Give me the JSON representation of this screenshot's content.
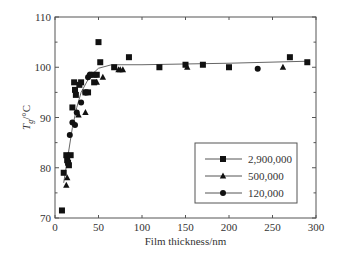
{
  "chart_data": {
    "type": "scatter",
    "title": "",
    "xlabel": "Film thickness/nm",
    "ylabel": "T_g/°C",
    "ylabel_main": "T",
    "ylabel_sub": "g",
    "ylabel_unit": "/°C",
    "xlim": [
      0,
      300
    ],
    "ylim": [
      70,
      110
    ],
    "xticks": [
      0,
      50,
      100,
      150,
      200,
      250,
      300
    ],
    "yticks": [
      70,
      80,
      90,
      100,
      110
    ],
    "grid": false,
    "legend_position": "lower right",
    "series": [
      {
        "name": "2,900,000",
        "marker": "square",
        "points": [
          [
            8,
            71.5
          ],
          [
            10,
            79
          ],
          [
            13,
            82.5
          ],
          [
            14,
            81.5
          ],
          [
            15,
            81
          ],
          [
            16,
            80.5
          ],
          [
            18,
            82.5
          ],
          [
            20,
            92
          ],
          [
            22,
            97
          ],
          [
            23,
            95.5
          ],
          [
            24,
            94.5
          ],
          [
            28,
            96.5
          ],
          [
            30,
            97
          ],
          [
            35,
            95
          ],
          [
            38,
            95
          ],
          [
            42,
            98.5
          ],
          [
            45,
            97
          ],
          [
            48,
            98.5
          ],
          [
            50,
            105
          ],
          [
            52,
            101
          ],
          [
            68,
            100
          ],
          [
            85,
            102
          ],
          [
            120,
            100
          ],
          [
            150,
            100.5
          ],
          [
            170,
            100.5
          ],
          [
            200,
            100
          ],
          [
            270,
            102
          ],
          [
            290,
            101
          ]
        ]
      },
      {
        "name": "500,000",
        "marker": "triangle",
        "points": [
          [
            13,
            76.5
          ],
          [
            14,
            78
          ],
          [
            27,
            90.5
          ],
          [
            35,
            91
          ],
          [
            48,
            97
          ],
          [
            55,
            98
          ],
          [
            73,
            99.5
          ],
          [
            75,
            99.5
          ],
          [
            78,
            99.5
          ],
          [
            152,
            100
          ],
          [
            262,
            100
          ]
        ]
      },
      {
        "name": "120,000",
        "marker": "circle",
        "points": [
          [
            17,
            86.5
          ],
          [
            20,
            89
          ],
          [
            23,
            88.5
          ],
          [
            25,
            91
          ],
          [
            30,
            93
          ],
          [
            35,
            95
          ],
          [
            38,
            98
          ],
          [
            40,
            98.5
          ],
          [
            42,
            98.5
          ],
          [
            47,
            98.5
          ],
          [
            233,
            99.7
          ]
        ]
      }
    ],
    "fit_line": [
      [
        10,
        77
      ],
      [
        15,
        82.5
      ],
      [
        20,
        88
      ],
      [
        25,
        92
      ],
      [
        30,
        95
      ],
      [
        40,
        98.2
      ],
      [
        50,
        99.8
      ],
      [
        65,
        100.5
      ],
      [
        100,
        100.5
      ],
      [
        200,
        100.8
      ],
      [
        290,
        101.2
      ]
    ]
  }
}
